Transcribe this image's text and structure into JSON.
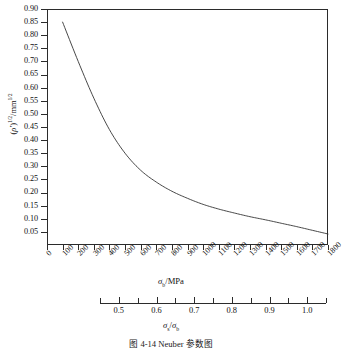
{
  "caption": "图 4-14  Neuber 参数图",
  "axis": {
    "y_title_prefix": "(",
    "y_title_symbol": "ρ'",
    "y_title_mid": ")",
    "y_title_exp1": "1/2",
    "y_title_unit": "/mm",
    "y_title_exp2": "1/2",
    "x_title_symbol": "σ",
    "x_title_sub": "b",
    "x_title_unit": "/MPa",
    "sec_title_num_symbol": "σ",
    "sec_title_num_sub": "s",
    "sec_title_slash": "/",
    "sec_title_den_symbol": "σ",
    "sec_title_den_sub": "b"
  },
  "chart_data": {
    "type": "line",
    "title": "图 4-14  Neuber 参数图",
    "xlabel": "σb/MPa",
    "ylabel": "(ρ')^(1/2)/mm^(1/2)",
    "grid": false,
    "legend": "none",
    "xlim": [
      0,
      1800
    ],
    "ylim": [
      0.0,
      0.9
    ],
    "x_ticks": [
      0,
      100,
      200,
      300,
      400,
      500,
      600,
      700,
      800,
      900,
      1000,
      1100,
      1200,
      1300,
      1400,
      1500,
      1600,
      1700,
      1800
    ],
    "x_tick_labels": [
      "0",
      "100",
      "200",
      "300",
      "400",
      "500",
      "600",
      "700",
      "800",
      "900",
      "1000",
      "1100",
      "1200",
      "1300",
      "1400",
      "1500",
      "1600",
      "1700",
      "1800"
    ],
    "y_ticks": [
      0.05,
      0.1,
      0.15,
      0.2,
      0.25,
      0.3,
      0.35,
      0.4,
      0.45,
      0.5,
      0.55,
      0.6,
      0.65,
      0.7,
      0.75,
      0.8,
      0.85,
      0.9
    ],
    "y_tick_labels": [
      "0.05",
      "0.10",
      "0.15",
      "0.20",
      "0.25",
      "0.30",
      "0.35",
      "0.40",
      "0.45",
      "0.50",
      "0.55",
      "0.60",
      "0.65",
      "0.70",
      "0.75",
      "0.80",
      "0.85",
      "0.90"
    ],
    "secondary_axis": {
      "label": "σs/σb",
      "lim": [
        0.45,
        1.05
      ],
      "major_ticks": [
        0.5,
        0.6,
        0.7,
        0.8,
        0.9,
        1.0
      ],
      "major_tick_labels": [
        "0.5",
        "0.6",
        "0.7",
        "0.8",
        "0.9",
        "1.0"
      ],
      "minor_ticks": [
        0.45,
        0.55,
        0.65,
        0.75,
        0.85,
        0.95,
        1.05
      ]
    },
    "series": [
      {
        "name": "Neuber parameter",
        "color": "#333333",
        "x": [
          100,
          200,
          300,
          400,
          500,
          600,
          700,
          800,
          900,
          1000,
          1100,
          1200,
          1300,
          1400,
          1500,
          1600,
          1700,
          1800
        ],
        "y": [
          0.85,
          0.7,
          0.56,
          0.44,
          0.35,
          0.285,
          0.24,
          0.205,
          0.178,
          0.155,
          0.137,
          0.122,
          0.108,
          0.096,
          0.083,
          0.07,
          0.056,
          0.042
        ]
      }
    ]
  }
}
